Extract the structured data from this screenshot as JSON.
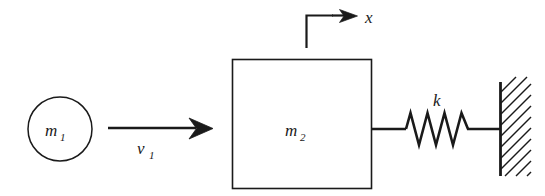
{
  "diagram": {
    "type": "mechanical-schematic",
    "background_color": "#ffffff",
    "line_color": "#1a1a1a",
    "labels": {
      "mass1": "m",
      "mass1_sub": "1",
      "mass2": "m",
      "mass2_sub": "2",
      "velocity": "v",
      "velocity_sub": "1",
      "spring": "k",
      "coordinate": "x"
    },
    "elements": {
      "mass1_shape": "circle",
      "mass2_shape": "square",
      "spring_shape": "zigzag",
      "wall_shape": "hatched-vertical-line",
      "velocity_arrow": "right-arrow",
      "coordinate_marker": "L-shaped-axis-with-right-arrow"
    },
    "geometry": {
      "circle_center_x": 60,
      "circle_center_y": 129,
      "circle_radius": 32,
      "box_left": 232,
      "box_top": 59,
      "box_width": 139,
      "box_height": 129,
      "velocity_arrow_start_x": 108,
      "velocity_arrow_end_x": 213,
      "velocity_arrow_y": 128,
      "spring_start_x": 405,
      "spring_end_x": 472,
      "spring_peaks": 4,
      "wall_x": 500,
      "wall_top": 82,
      "wall_bottom": 176,
      "hatch_count": 9,
      "axis_stem_x": 306,
      "axis_stem_top": 15,
      "axis_stem_bottom": 48,
      "axis_arrow_end_x": 357,
      "axis_arrow_y": 16
    }
  }
}
